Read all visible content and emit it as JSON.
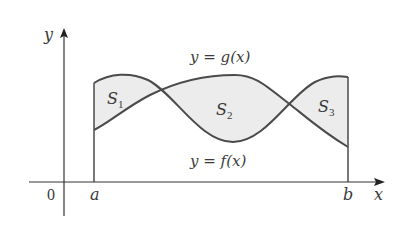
{
  "diagram": {
    "type": "area-between-curves",
    "axes": {
      "x_label": "x",
      "y_label": "y",
      "origin_label": "0"
    },
    "bounds": {
      "left": "a",
      "right": "b"
    },
    "curves": [
      {
        "name": "g",
        "label": "y = g(x)"
      },
      {
        "name": "f",
        "label": "y = f(x)"
      }
    ],
    "regions": [
      {
        "label": "S",
        "subscript": "1"
      },
      {
        "label": "S",
        "subscript": "2"
      },
      {
        "label": "S",
        "subscript": "3"
      }
    ],
    "colors": {
      "stroke": "#4a4a4a",
      "fill": "#ececec",
      "axis": "#333333"
    }
  }
}
